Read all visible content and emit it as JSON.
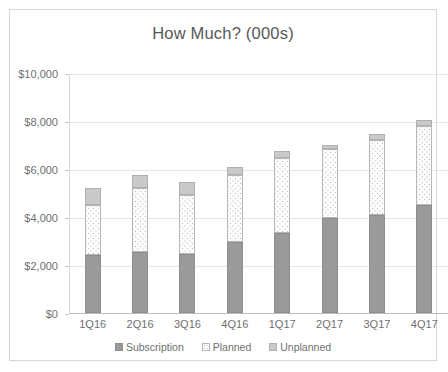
{
  "chart_data": {
    "type": "bar",
    "subtype": "stacked-column",
    "title": "How Much? (000s)",
    "xlabel": "",
    "ylabel": "",
    "ylim": [
      0,
      10000
    ],
    "ytick_values": [
      0,
      2000,
      4000,
      6000,
      8000,
      10000
    ],
    "ytick_labels": [
      "$0",
      "$2,000",
      "$4,000",
      "$6,000",
      "$8,000",
      "$10,000"
    ],
    "grid": true,
    "legend_position": "bottom",
    "categories": [
      "1Q16",
      "2Q16",
      "3Q16",
      "4Q16",
      "1Q17",
      "2Q17",
      "3Q17",
      "4Q17"
    ],
    "series": [
      {
        "name": "Subscription",
        "color": "#9a9a9a",
        "fill": "solid",
        "values": [
          2400,
          2550,
          2450,
          2950,
          3350,
          3950,
          4100,
          4500
        ]
      },
      {
        "name": "Planned",
        "color": "#fcfcfc",
        "fill": "dotted",
        "values": [
          2100,
          2650,
          2450,
          2800,
          3100,
          2900,
          3100,
          3300
        ]
      },
      {
        "name": "Unplanned",
        "color": "#c9c9c9",
        "fill": "solid",
        "values": [
          700,
          550,
          550,
          350,
          300,
          150,
          250,
          250
        ]
      }
    ],
    "totals": [
      5200,
      5750,
      5450,
      6100,
      6750,
      7000,
      7450,
      8050
    ]
  },
  "legend": {
    "items": [
      {
        "label": "Subscription",
        "swatch": "subscription-swatch"
      },
      {
        "label": "Planned",
        "swatch": "planned-swatch"
      },
      {
        "label": "Unplanned",
        "swatch": "unplanned-swatch"
      }
    ]
  },
  "colors": {
    "subscription": "#9a9a9a",
    "planned": "#fcfcfc",
    "unplanned": "#c9c9c9",
    "gridline": "#e4e4e4",
    "text": "#6f6f6f",
    "frame_border": "#d6d6d6"
  }
}
